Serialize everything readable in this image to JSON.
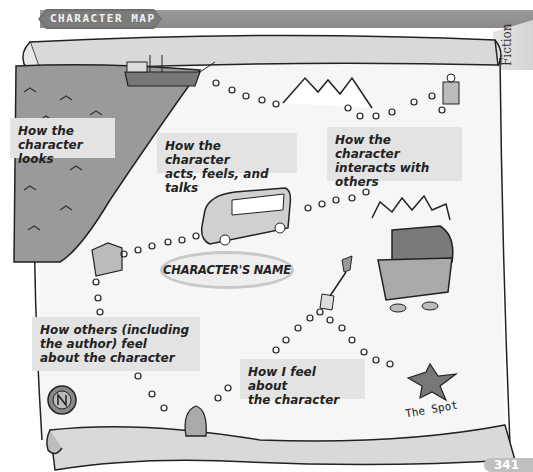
{
  "header": {
    "banner_title": "CHARACTER MAP",
    "side_tab": "Fiction"
  },
  "map": {
    "center_label": "CHARACTER'S NAME",
    "labels": [
      {
        "id": "looks",
        "lines": [
          "How the",
          "character looks"
        ]
      },
      {
        "id": "acts",
        "lines": [
          "How the character",
          "acts, feels, and talks"
        ]
      },
      {
        "id": "interacts",
        "lines": [
          "How the character",
          "interacts with",
          "others"
        ]
      },
      {
        "id": "others_feel",
        "lines": [
          "How others (including",
          "the author) feel",
          "about the character"
        ]
      },
      {
        "id": "i_feel",
        "lines": [
          "How I feel about",
          "the character"
        ]
      }
    ],
    "spot_label": "The Spot",
    "icons": [
      "sea-icon",
      "ship-icon",
      "mountains-icon",
      "castle-icon",
      "bus-icon",
      "building-icon",
      "treasure-chest-icon",
      "shovel-icon",
      "compass-icon",
      "penguin-icon",
      "x-mark-icon"
    ]
  },
  "footer": {
    "page_number": "341"
  },
  "colors": {
    "banner": "#8a8a8a",
    "label_bg": "#e3e3e3",
    "sea": "#9a9a9a",
    "scroll_roll": "#d9d9d9",
    "oval_border": "#c8c8c8"
  }
}
